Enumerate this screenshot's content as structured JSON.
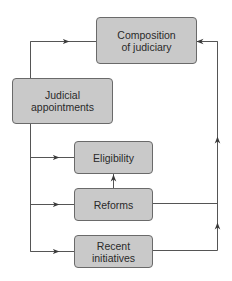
{
  "diagram": {
    "nodes": [
      {
        "id": "composition",
        "label": "Composition\nof judiciary"
      },
      {
        "id": "appointments",
        "label": "Judicial\nappointments"
      },
      {
        "id": "eligibility",
        "label": "Eligibility"
      },
      {
        "id": "reforms",
        "label": "Reforms"
      },
      {
        "id": "recent",
        "label": "Recent\ninitiatives"
      }
    ],
    "edges": [
      {
        "from": "appointments",
        "to": "composition"
      },
      {
        "from": "appointments",
        "to": "eligibility"
      },
      {
        "from": "appointments",
        "to": "reforms"
      },
      {
        "from": "appointments",
        "to": "recent"
      },
      {
        "from": "reforms",
        "to": "eligibility"
      },
      {
        "from": "reforms",
        "to": "composition"
      },
      {
        "from": "recent",
        "to": "composition"
      }
    ],
    "colors": {
      "box_fill": "#c9c9c9",
      "box_border": "#6a6a6a",
      "line": "#555555"
    }
  }
}
